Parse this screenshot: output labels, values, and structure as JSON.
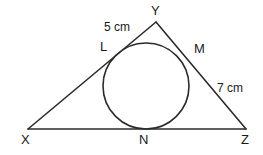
{
  "figure": {
    "stroke_color": "#2b2b2b",
    "background_color": "#ffffff",
    "vertices": [
      {
        "id": "X",
        "label": "X",
        "x": 28,
        "y": 129
      },
      {
        "id": "Y",
        "label": "Y",
        "x": 156,
        "y": 22
      },
      {
        "id": "Z",
        "label": "Z",
        "x": 246,
        "y": 129
      }
    ],
    "tangent_points": [
      {
        "id": "L",
        "label": "L",
        "x": 112,
        "y": 61,
        "on_side": "XY"
      },
      {
        "id": "M",
        "label": "M",
        "x": 186,
        "y": 57,
        "on_side": "YZ"
      },
      {
        "id": "N",
        "label": "N",
        "x": 145,
        "y": 129,
        "on_side": "XZ"
      }
    ],
    "incircle": {
      "cx": 146,
      "cy": 86,
      "r": 43
    },
    "measurements": [
      {
        "id": "YL",
        "label": "5 cm",
        "value": 5,
        "unit": "cm",
        "segment": "Y to L"
      },
      {
        "id": "MZ",
        "label": "7 cm",
        "value": 7,
        "unit": "cm",
        "segment": "M to Z"
      }
    ]
  }
}
